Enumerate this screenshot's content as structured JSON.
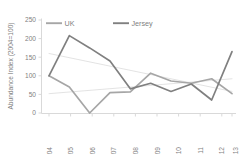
{
  "chart_data": {
    "type": "line",
    "title": "",
    "xlabel": "",
    "ylabel": "Abundance Index (2004=100)",
    "categories": [
      "2004",
      "2005",
      "2006",
      "2007",
      "2008",
      "2009",
      "2010",
      "2011",
      "2012",
      "2013"
    ],
    "ylim": [
      0,
      250
    ],
    "yticks": [
      0,
      50,
      100,
      150,
      200,
      250
    ],
    "ytick_labels": [
      "0",
      "50",
      "100",
      "150",
      "200",
      "250"
    ],
    "grid": false,
    "legend_position": "top",
    "series": [
      {
        "name": "UK",
        "color": "#a6a6a6",
        "values": [
          100,
          70,
          0,
          55,
          57,
          107,
          86,
          80,
          92,
          52
        ]
      },
      {
        "name": "Jersey",
        "color": "#808080",
        "values": [
          100,
          208,
          175,
          140,
          65,
          80,
          58,
          78,
          35,
          165
        ]
      }
    ],
    "trendlines": [
      {
        "name": "Jersey trend",
        "color": "#e0e0e0",
        "start": {
          "x": "2004",
          "y": 160
        },
        "end": {
          "x": "2013",
          "y": 58
        }
      },
      {
        "name": "UK trend",
        "color": "#e0e0e0",
        "start": {
          "x": "2004",
          "y": 52
        },
        "end": {
          "x": "2013",
          "y": 92
        }
      }
    ]
  },
  "legend": {
    "items": [
      {
        "label": "UK",
        "color": "#a6a6a6"
      },
      {
        "label": "Jersey",
        "color": "#808080"
      }
    ]
  },
  "axes": {
    "y_title": "Abundance Index (2004=100)",
    "y_tick_0": "0",
    "y_tick_1": "50",
    "y_tick_2": "100",
    "y_tick_3": "150",
    "y_tick_4": "200",
    "y_tick_5": "250",
    "x_tick_0": "2004",
    "x_tick_1": "2005",
    "x_tick_2": "2006",
    "x_tick_3": "2007",
    "x_tick_4": "2008",
    "x_tick_5": "2009",
    "x_tick_6": "2010",
    "x_tick_7": "2011",
    "x_tick_8": "2012",
    "x_tick_9": "2013"
  },
  "caption": {
    "text": ""
  }
}
